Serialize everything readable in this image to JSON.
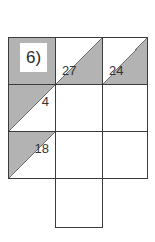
{
  "worksheet": {
    "problem_label": "6)",
    "background_color": "#ffffff",
    "shaded_color": "#b3b3b3",
    "line_color": "#3b3b3b",
    "grid": {
      "columns": 3,
      "rows": 4,
      "cells": [
        {
          "row": 0,
          "col": 0,
          "shading": "full",
          "value": "",
          "label": "6)"
        },
        {
          "row": 0,
          "col": 1,
          "shading": "upper-right",
          "value": "27",
          "label": ""
        },
        {
          "row": 0,
          "col": 2,
          "shading": "upper-right",
          "value": "24",
          "label": ""
        },
        {
          "row": 1,
          "col": 0,
          "shading": "lower-left",
          "value": "4",
          "label": ""
        },
        {
          "row": 1,
          "col": 1,
          "shading": "none",
          "value": "",
          "label": ""
        },
        {
          "row": 1,
          "col": 2,
          "shading": "none",
          "value": "",
          "label": ""
        },
        {
          "row": 2,
          "col": 0,
          "shading": "lower-left",
          "value": "18",
          "label": ""
        },
        {
          "row": 2,
          "col": 1,
          "shading": "none",
          "value": "",
          "label": ""
        },
        {
          "row": 2,
          "col": 2,
          "shading": "none",
          "value": "",
          "label": ""
        },
        {
          "row": 3,
          "col": 1,
          "shading": "none",
          "value": "",
          "label": ""
        }
      ]
    },
    "numbers": {
      "top_middle": "27",
      "top_right": "24",
      "left_middle": "4",
      "left_lower": "18"
    }
  }
}
